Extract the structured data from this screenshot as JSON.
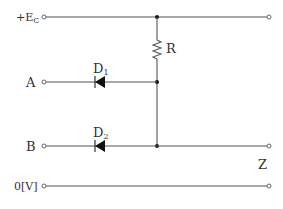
{
  "diagram": {
    "type": "diode AND logic gate circuit",
    "labels": {
      "supply": "+E",
      "supply_sub": "C",
      "input_a": "A",
      "input_b": "B",
      "ground": "0[V]",
      "output": "Z",
      "resistor": "R",
      "diode1": "D",
      "diode1_sub": "1",
      "diode2": "D",
      "diode2_sub": "2"
    },
    "colors": {
      "wire": "#555555",
      "component": "#111111",
      "text": "#333333"
    }
  }
}
